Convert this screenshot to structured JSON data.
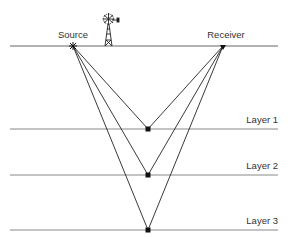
{
  "diagram": {
    "type": "seismic-reflection",
    "source_label": "Source",
    "receiver_label": "Receiver",
    "layers": [
      {
        "label": "Layer 1"
      },
      {
        "label": "Layer 2"
      },
      {
        "label": "Layer 3"
      }
    ],
    "icons": [
      "windmill-icon",
      "source-marker-icon",
      "receiver-marker-icon"
    ]
  }
}
